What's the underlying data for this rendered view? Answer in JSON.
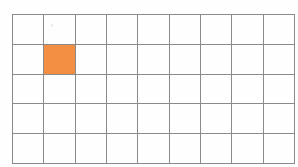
{
  "canvas": {
    "width": 298,
    "height": 167,
    "background_color": "#ffffff"
  },
  "grid": {
    "name": "rectangular-grid",
    "columns": 9,
    "rows": 5,
    "left": 12,
    "top": 14,
    "right": 285,
    "bottom": 158,
    "cell_width": 30.3,
    "cell_height": 28.8,
    "line_color": "#8a8a8a",
    "line_width": 1,
    "cell_background": "#fefefe"
  },
  "highlight": {
    "fill_color": "#f38f42",
    "cells": [
      {
        "row": 2,
        "column": 2
      }
    ],
    "count": 1,
    "label": "shaded-square"
  },
  "artifacts": {
    "speck": {
      "left": 51,
      "top": 24
    }
  }
}
